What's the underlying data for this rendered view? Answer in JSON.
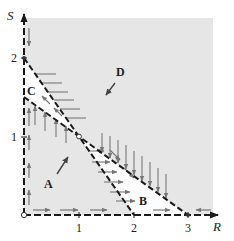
{
  "figure": {
    "type": "phase-plane",
    "colors": {
      "shaded_region": "#e6e6e6",
      "white_region": "#ffffff",
      "lines": "#1a1a1a",
      "arrows": "#777777",
      "region_arrows": "#555555"
    }
  },
  "axes": {
    "x": {
      "label": "R",
      "ticks": [
        {
          "value": 1,
          "label": "1"
        },
        {
          "value": 2,
          "label": "2"
        },
        {
          "value": 3,
          "label": "3"
        }
      ]
    },
    "y": {
      "label": "S",
      "ticks": [
        {
          "value": 1,
          "label": "1"
        },
        {
          "value": 2,
          "label": "2"
        }
      ]
    }
  },
  "nullclines": [
    {
      "name": "nullcline-steep",
      "from": [
        0,
        2
      ],
      "to": [
        2,
        0
      ],
      "style": "dashed"
    },
    {
      "name": "nullcline-shallow",
      "from": [
        0,
        1.5
      ],
      "to": [
        3,
        0
      ],
      "style": "dashed"
    }
  ],
  "equilibria": [
    {
      "name": "origin",
      "point": [
        0,
        0
      ],
      "marker": "open-circle"
    },
    {
      "name": "interior",
      "point": [
        1,
        1
      ],
      "marker": "open-circle"
    },
    {
      "name": "s-intercept",
      "point": [
        0,
        2
      ],
      "marker": "dot"
    },
    {
      "name": "r-intercept",
      "point": [
        3,
        0
      ],
      "marker": "dot"
    }
  ],
  "regions": [
    {
      "label": "A",
      "direction": "up-right"
    },
    {
      "label": "B",
      "direction": ""
    },
    {
      "label": "C",
      "direction": ""
    },
    {
      "label": "D",
      "direction": "down-left"
    }
  ]
}
